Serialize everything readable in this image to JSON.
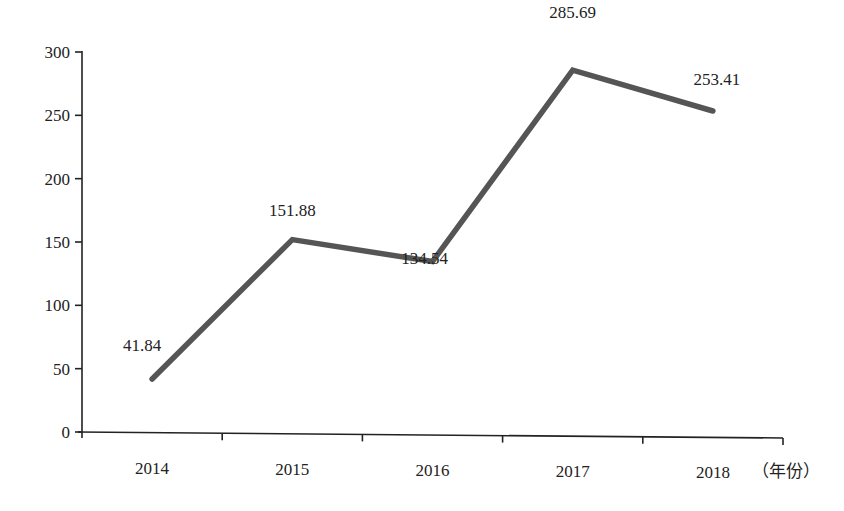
{
  "chart_data": {
    "type": "line",
    "title": "",
    "xlabel": "（年份）",
    "ylabel": "",
    "categories": [
      "2014",
      "2015",
      "2016",
      "2017",
      "2018"
    ],
    "series": [
      {
        "name": "value",
        "values": [
          41.84,
          151.88,
          134.54,
          285.69,
          253.41
        ],
        "color": "#555555"
      }
    ],
    "data_labels": [
      "41.84",
      "151.88",
      "134.54",
      "285.69",
      "253.41"
    ],
    "yticks": [
      0,
      50,
      100,
      150,
      200,
      250,
      300
    ],
    "ytick_labels": [
      "0",
      "50",
      "100",
      "150",
      "200",
      "250",
      "300"
    ],
    "ylim": [
      0,
      300
    ],
    "grid": false,
    "legend": null
  }
}
